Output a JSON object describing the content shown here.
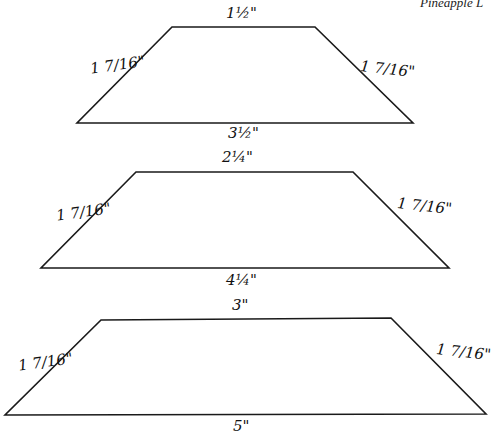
{
  "header": {
    "text": "Pineapple L"
  },
  "colors": {
    "stroke": "#1a1a1a",
    "background": "#ffffff"
  },
  "trapezoids": [
    {
      "top": "1½\"",
      "left": "1 7/16\"",
      "right": "1 7/16\"",
      "bottom": "3½\"",
      "points": "172,27 315,27 413,123 77,123"
    },
    {
      "top": "2¼\"",
      "left": "1 7/16\"",
      "right": "1 7/16\"",
      "bottom": "4¼\"",
      "points": "136,172 353,172 449,268 41,268"
    },
    {
      "top": "3\"",
      "left": "1 7/16\"",
      "right": "1 7/16\"",
      "bottom": "5\"",
      "points": "101,320 391,318 486,414 5,415"
    }
  ]
}
